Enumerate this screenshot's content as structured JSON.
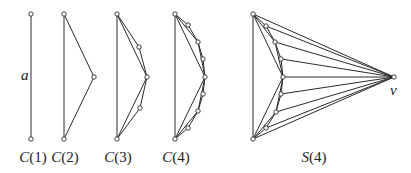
{
  "diagram": {
    "colors": {
      "line": "#2a2a2a",
      "vertex_fill": "#ffffff",
      "text": "#222222"
    },
    "graphs": [
      {
        "id": "C1",
        "caption": {
          "letter": "C",
          "arg": "(1)",
          "x": 33,
          "y": 162
        },
        "vertices": [
          [
            31,
            14
          ],
          [
            31,
            139
          ]
        ],
        "edges": [
          [
            0,
            1
          ]
        ],
        "labels": [
          {
            "text": "a",
            "x": 21,
            "y": 80
          }
        ]
      },
      {
        "id": "C2",
        "caption": {
          "letter": "C",
          "arg": "(2)",
          "x": 65,
          "y": 162
        },
        "vertices": [
          [
            64,
            14
          ],
          [
            64,
            139
          ],
          [
            94,
            77
          ]
        ],
        "edges": [
          [
            0,
            1
          ],
          [
            0,
            2
          ],
          [
            2,
            1
          ]
        ],
        "labels": []
      },
      {
        "id": "C3",
        "caption": {
          "letter": "C",
          "arg": "(3)",
          "x": 118,
          "y": 162
        },
        "vertices": [
          [
            117,
            14
          ],
          [
            117,
            139
          ],
          [
            147,
            77
          ],
          [
            139,
            47
          ],
          [
            140,
            108
          ]
        ],
        "edges": [
          [
            0,
            1
          ],
          [
            0,
            2
          ],
          [
            2,
            1
          ],
          [
            0,
            3
          ],
          [
            3,
            2
          ],
          [
            2,
            4
          ],
          [
            4,
            1
          ]
        ],
        "labels": []
      },
      {
        "id": "C4",
        "caption": {
          "letter": "C",
          "arg": "(4)",
          "x": 176,
          "y": 162
        },
        "vertices": [
          [
            175,
            14
          ],
          [
            175,
            139
          ],
          [
            205,
            77
          ],
          [
            198,
            42
          ],
          [
            198,
            111
          ],
          [
            188,
            25
          ],
          [
            203,
            59
          ],
          [
            203,
            94
          ],
          [
            188,
            128
          ]
        ],
        "edges": [
          [
            0,
            1
          ],
          [
            0,
            2
          ],
          [
            2,
            1
          ],
          [
            0,
            3
          ],
          [
            3,
            2
          ],
          [
            2,
            4
          ],
          [
            4,
            1
          ],
          [
            0,
            5
          ],
          [
            5,
            3
          ],
          [
            3,
            6
          ],
          [
            6,
            2
          ],
          [
            2,
            7
          ],
          [
            7,
            4
          ],
          [
            4,
            8
          ],
          [
            8,
            1
          ]
        ],
        "labels": []
      },
      {
        "id": "S4",
        "caption": {
          "letter": "S",
          "arg": "(4)",
          "x": 314,
          "y": 162
        },
        "vertices": [
          [
            253,
            14
          ],
          [
            253,
            139
          ],
          [
            283,
            77
          ],
          [
            275,
            42
          ],
          [
            276,
            112
          ],
          [
            266,
            26
          ],
          [
            281,
            59
          ],
          [
            281,
            94
          ],
          [
            266,
            128
          ],
          [
            394,
            77
          ]
        ],
        "edges": [
          [
            0,
            1
          ],
          [
            0,
            2
          ],
          [
            2,
            1
          ],
          [
            0,
            3
          ],
          [
            3,
            2
          ],
          [
            2,
            4
          ],
          [
            4,
            1
          ],
          [
            0,
            5
          ],
          [
            5,
            3
          ],
          [
            3,
            6
          ],
          [
            6,
            2
          ],
          [
            2,
            7
          ],
          [
            7,
            4
          ],
          [
            4,
            8
          ],
          [
            8,
            1
          ],
          [
            0,
            9
          ],
          [
            1,
            9
          ],
          [
            2,
            9
          ],
          [
            3,
            9
          ],
          [
            4,
            9
          ],
          [
            5,
            9
          ],
          [
            6,
            9
          ],
          [
            7,
            9
          ],
          [
            8,
            9
          ]
        ],
        "labels": [
          {
            "text": "v",
            "x": 390,
            "y": 95
          }
        ]
      }
    ]
  }
}
